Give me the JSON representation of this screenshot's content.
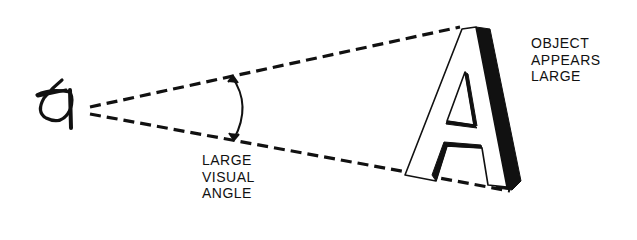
{
  "diagram": {
    "labels": {
      "visual_angle": [
        "LARGE",
        "VISUAL",
        "ANGLE"
      ],
      "object": [
        "OBJECT",
        "APPEARS",
        "LARGE"
      ]
    },
    "object_letter": "A",
    "colors": {
      "ink": "#111111",
      "background": "#ffffff"
    }
  }
}
